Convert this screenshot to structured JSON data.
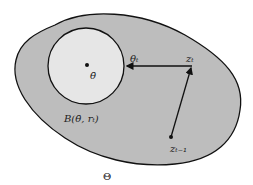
{
  "diagram": {
    "colors": {
      "region_fill": "#bdbdbd",
      "ball_fill": "#e6e6e6",
      "stroke": "#111111",
      "background": "#ffffff"
    },
    "labels": {
      "region": "Θ",
      "ball": "B(θ̄, rₜ)",
      "center": "θ̄",
      "theta_t": "θₜ",
      "z_t": "zₜ",
      "z_t_minus_1": "zₜ₋₁"
    }
  }
}
